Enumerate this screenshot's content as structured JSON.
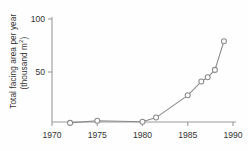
{
  "chart_data": {
    "type": "line",
    "title": "",
    "xlabel": "",
    "ylabel": "Total facing area per year (thousand m²)",
    "ylabel_line1": "Total facing area per year",
    "ylabel_line2_pre": "(thousand m",
    "ylabel_line2_sup": "2",
    "ylabel_line2_post": ")",
    "xlim": [
      1970,
      1990
    ],
    "ylim": [
      0,
      100
    ],
    "xticks": [
      1970,
      1975,
      1980,
      1985,
      1990
    ],
    "xtick_labels": [
      "1970",
      "1975",
      "1980",
      "1985",
      "1990"
    ],
    "yticks": [
      50,
      100
    ],
    "ytick_labels": [
      "50",
      "100"
    ],
    "grid": false,
    "legend": false,
    "marker": "open-circle",
    "line_color": "#8a8a8a",
    "marker_color": "#8a8a8a",
    "axis_color": "#9a9a9a",
    "x": [
      1972,
      1975,
      1980,
      1981.5,
      1985,
      1986.5,
      1987.2,
      1988,
      1989
    ],
    "values": [
      2,
      4,
      3,
      7,
      28,
      41,
      45,
      52,
      79
    ],
    "points": [
      {
        "x": 1972,
        "y": 2
      },
      {
        "x": 1975,
        "y": 4
      },
      {
        "x": 1980,
        "y": 3
      },
      {
        "x": 1981.5,
        "y": 7
      },
      {
        "x": 1985,
        "y": 28
      },
      {
        "x": 1986.5,
        "y": 41
      },
      {
        "x": 1987.2,
        "y": 45
      },
      {
        "x": 1988,
        "y": 52
      },
      {
        "x": 1989,
        "y": 79
      }
    ]
  }
}
